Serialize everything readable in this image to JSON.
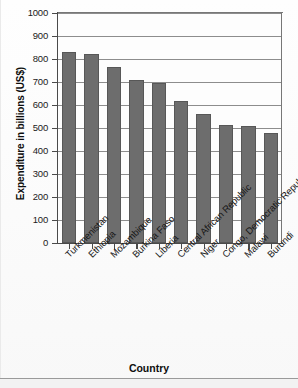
{
  "chart_data": {
    "type": "bar",
    "title": "",
    "xlabel": "Country",
    "ylabel": "Expenditure in billions (US$)",
    "ylim": [
      0,
      1000
    ],
    "ytick_step": 100,
    "grid": true,
    "legend": "none",
    "bar_color": "#6d6d6d",
    "bar_edge_color": "#575757",
    "categories": [
      "Turkmenistan",
      "Ethiopia",
      "Mozambique",
      "Burkina Faso",
      "Liberia",
      "Central African Republic",
      "Niger",
      "Congo, Democratic Republic of the",
      "Malawi",
      "Burundi"
    ],
    "values": [
      830,
      820,
      765,
      710,
      695,
      618,
      562,
      515,
      508,
      480
    ],
    "ytick_labels": [
      "0",
      "100",
      "200",
      "300",
      "400",
      "500",
      "600",
      "700",
      "800",
      "900",
      "1000"
    ],
    "ytick_values": [
      0,
      100,
      200,
      300,
      400,
      500,
      600,
      700,
      800,
      900,
      1000
    ]
  }
}
